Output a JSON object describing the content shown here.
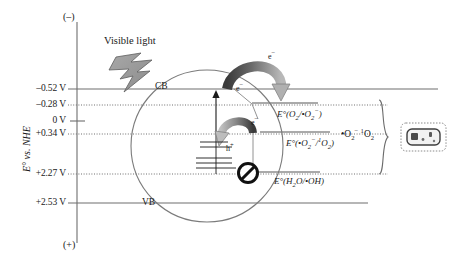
{
  "figure": {
    "type": "energy-band-diagram",
    "axis": {
      "title": "E° vs. NHE",
      "top_sign": "(–)",
      "bottom_sign": "(+)",
      "ticks": [
        {
          "label": "–0.52 V",
          "value": -0.52,
          "y": 89,
          "line": "solid"
        },
        {
          "label": "–0.28 V",
          "value": -0.28,
          "y": 105,
          "line": "dotted"
        },
        {
          "label": "0 V",
          "value": 0.0,
          "y": 121,
          "line": "tick"
        },
        {
          "label": "+0.34 V",
          "value": 0.34,
          "y": 134,
          "line": "dotted"
        },
        {
          "label": "+2.27 V",
          "value": 2.27,
          "y": 174,
          "line": "dotted"
        },
        {
          "label": "+2.53 V",
          "value": 2.53,
          "y": 203,
          "line": "solid"
        }
      ]
    },
    "bands": {
      "conduction_label": "CB",
      "valence_label": "VB"
    },
    "excitation": {
      "source_label": "Visible light",
      "icon": "lightning-bolt"
    },
    "carriers": {
      "electron_top": "e−",
      "electron_cb": "e−",
      "electron_mid": "e−",
      "hole": "h+"
    },
    "redox_couples": [
      {
        "id": "o2-superoxide",
        "label": "E°(O₂/•O₂⁻)",
        "y": 105
      },
      {
        "id": "superoxide-singlet-oxygen",
        "label": "E°(•O₂⁻/¹O₂)",
        "y": 134
      },
      {
        "id": "water-hydroxyl",
        "label": "E°(H₂O/•OH)",
        "y": 174,
        "blocked": true
      }
    ],
    "products": {
      "label": "•O₂⁻ ¹O₂",
      "bracket": "right-curly-brace",
      "target_icon": "bacterium-cell"
    },
    "blocked_marker": {
      "name": "prohibition-sign",
      "meaning": "reaction not allowed"
    }
  },
  "colors": {
    "line": "#6e6e6e",
    "text": "#1a1a1a",
    "arrow_dark": "#3a3a3a",
    "arrow_light": "#b0b0b0",
    "bolt_fill": "#9a9a9a",
    "background": "#ffffff"
  }
}
